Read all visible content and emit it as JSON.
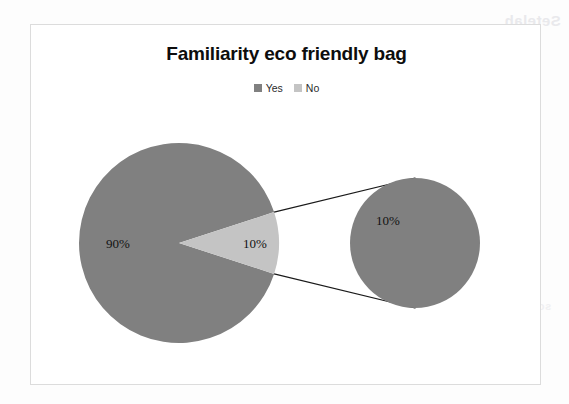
{
  "page": {
    "background_color": "#fdfdfd",
    "bleed_through_text": [
      "Setelah",
      "penggunaan bahan",
      "sosialisasi",
      "ramah lingkungan",
      "kantong"
    ]
  },
  "chart_frame": {
    "border_color": "#dcdcdc",
    "background_color": "#ffffff"
  },
  "colors": {
    "series_yes": "#808080",
    "series_no": "#c4c4c4",
    "secondary_slice": "#808080",
    "connector_line": "#1a1a1a",
    "label_text": "#121212",
    "title_text": "#0d0d0d"
  },
  "chart_data": {
    "type": "pie",
    "variant": "pie-of-pie",
    "title": "Familiarity eco friendly bag",
    "subtitle": "",
    "xlabel": "",
    "ylabel": "",
    "labels": [
      "Yes",
      "No"
    ],
    "values": [
      90,
      10
    ],
    "value_labels": [
      "90%",
      "10%"
    ],
    "units": "percent",
    "legend": {
      "position": "top",
      "entries": [
        {
          "label": "Yes",
          "color": "#808080"
        },
        {
          "label": "No",
          "color": "#c4c4c4"
        }
      ]
    },
    "annotations": [
      {
        "text": "90%",
        "slice": "Yes"
      },
      {
        "text": "10%",
        "slice": "No"
      },
      {
        "text": "10%",
        "slice": "No-exploded-secondary"
      }
    ],
    "secondary_plot": {
      "type": "pie",
      "labels": [
        "No"
      ],
      "values": [
        10
      ],
      "value_labels": [
        "10%"
      ],
      "color": "#808080",
      "connected_by": "two-leader-lines"
    },
    "grid": false
  },
  "geometry": {
    "main_pie": {
      "cx": 148,
      "cy": 218,
      "r": 100
    },
    "secondary_pie": {
      "cx": 384,
      "cy": 218,
      "r": 65
    },
    "main_label_90": {
      "x": 75,
      "y": 223
    },
    "main_label_10": {
      "x": 212,
      "y": 223
    },
    "secondary_label_10": {
      "x": 345,
      "y": 200
    }
  }
}
